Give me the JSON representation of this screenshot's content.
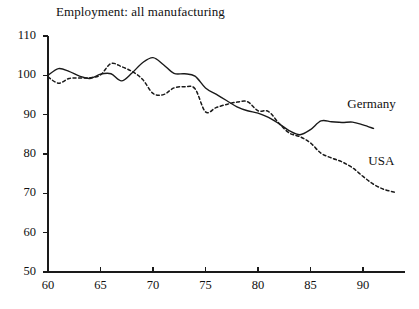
{
  "chart_data": {
    "type": "line",
    "title": "Employment: all manufacturing",
    "xlabel": "",
    "ylabel": "",
    "xlim": [
      60,
      93.5
    ],
    "ylim": [
      50,
      110
    ],
    "grid": false,
    "legend_position": "inline-right",
    "xticks": [
      60,
      65,
      70,
      75,
      80,
      85,
      90
    ],
    "xtick_labels": [
      "60",
      "65",
      "70",
      "75",
      "80",
      "85",
      "90"
    ],
    "yticks": [
      50,
      60,
      70,
      80,
      90,
      100,
      110
    ],
    "ytick_labels": [
      "50",
      "60",
      "70",
      "80",
      "90",
      "100",
      "110"
    ],
    "x": [
      60,
      61,
      62,
      63,
      64,
      65,
      66,
      67,
      68,
      69,
      70,
      71,
      72,
      73,
      74,
      75,
      76,
      77,
      78,
      79,
      80,
      81,
      82,
      83,
      84,
      85,
      86,
      87,
      88,
      89,
      90,
      91,
      92,
      93
    ],
    "series": [
      {
        "name": "Germany",
        "style": "solid",
        "color": "#1a1a1a",
        "x": [
          60,
          61,
          62,
          63,
          64,
          65,
          66,
          67,
          68,
          69,
          70,
          71,
          72,
          73,
          74,
          75,
          76,
          77,
          78,
          79,
          80,
          81,
          82,
          83,
          84,
          85,
          86,
          87,
          88,
          89,
          90,
          91
        ],
        "values": [
          100.0,
          101.7,
          101.0,
          99.8,
          99.2,
          100.3,
          100.4,
          98.6,
          100.6,
          103.2,
          104.5,
          102.7,
          100.5,
          100.4,
          99.8,
          96.8,
          95.2,
          93.6,
          92.0,
          91.0,
          90.4,
          89.3,
          87.7,
          85.9,
          84.9,
          86.2,
          88.4,
          88.2,
          88.0,
          88.1,
          87.4,
          86.5
        ]
      },
      {
        "name": "USA",
        "style": "dashed",
        "color": "#1a1a1a",
        "x": [
          60,
          61,
          62,
          63,
          64,
          65,
          66,
          67,
          68,
          69,
          70,
          71,
          72,
          73,
          74,
          75,
          76,
          77,
          78,
          79,
          80,
          81,
          82,
          83,
          84,
          85,
          86,
          87,
          88,
          89,
          90,
          91,
          92,
          93
        ],
        "values": [
          99.6,
          98.0,
          99.2,
          99.3,
          99.4,
          100.1,
          103.0,
          102.2,
          101.0,
          99.0,
          95.4,
          95.1,
          96.8,
          97.1,
          96.6,
          90.7,
          91.8,
          92.6,
          93.2,
          93.3,
          91.0,
          90.8,
          87.8,
          85.3,
          84.4,
          82.8,
          80.2,
          79.0,
          78.0,
          76.5,
          74.3,
          72.3,
          71.0,
          70.3
        ]
      }
    ],
    "annotations": [
      {
        "text": "Germany",
        "x": 88.5,
        "y": 92.5
      },
      {
        "text": "USA",
        "x": 90.5,
        "y": 78.0
      }
    ]
  }
}
